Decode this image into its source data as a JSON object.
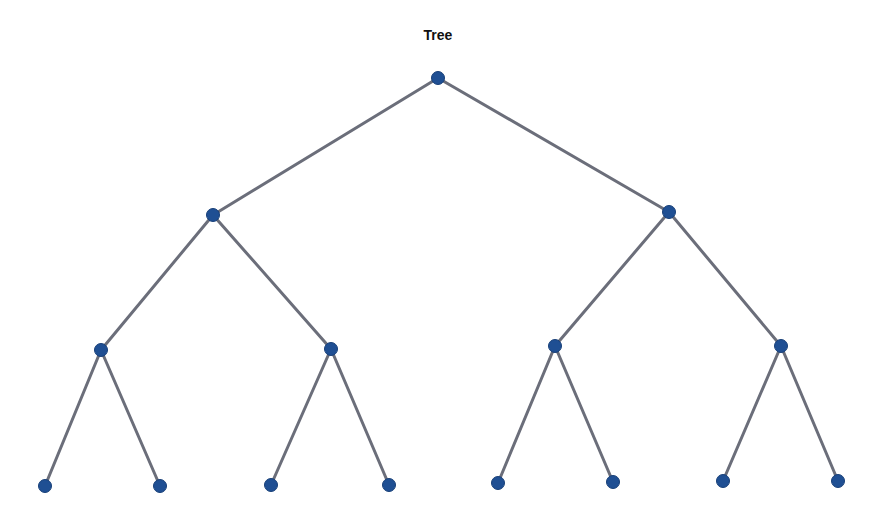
{
  "title": "Tree",
  "colors": {
    "node": "#1f4f93",
    "edge": "#6b6e7a"
  },
  "nodes": [
    {
      "id": 0,
      "x": 438,
      "y": 78
    },
    {
      "id": 1,
      "x": 213,
      "y": 215
    },
    {
      "id": 2,
      "x": 669,
      "y": 212
    },
    {
      "id": 3,
      "x": 101,
      "y": 350
    },
    {
      "id": 4,
      "x": 331,
      "y": 349
    },
    {
      "id": 5,
      "x": 555,
      "y": 346
    },
    {
      "id": 6,
      "x": 781,
      "y": 346
    },
    {
      "id": 7,
      "x": 45,
      "y": 486
    },
    {
      "id": 8,
      "x": 160,
      "y": 486
    },
    {
      "id": 9,
      "x": 271,
      "y": 485
    },
    {
      "id": 10,
      "x": 389,
      "y": 485
    },
    {
      "id": 11,
      "x": 498,
      "y": 483
    },
    {
      "id": 12,
      "x": 613,
      "y": 482
    },
    {
      "id": 13,
      "x": 723,
      "y": 481
    },
    {
      "id": 14,
      "x": 838,
      "y": 481
    }
  ],
  "edges": [
    [
      0,
      1
    ],
    [
      0,
      2
    ],
    [
      1,
      3
    ],
    [
      1,
      4
    ],
    [
      2,
      5
    ],
    [
      2,
      6
    ],
    [
      3,
      7
    ],
    [
      3,
      8
    ],
    [
      4,
      9
    ],
    [
      4,
      10
    ],
    [
      5,
      11
    ],
    [
      5,
      12
    ],
    [
      6,
      13
    ],
    [
      6,
      14
    ]
  ]
}
